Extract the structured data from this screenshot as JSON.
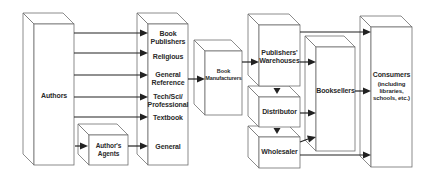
{
  "diagram": {
    "nodes": {
      "authors": {
        "label": "Authors"
      },
      "authors_agents": {
        "label_line1": "Author's",
        "label_line2": "Agents"
      },
      "publishers": {
        "title_line1": "Book",
        "title_line2": "Publishers",
        "categories": [
          {
            "line1": "Religious",
            "line2": ""
          },
          {
            "line1": "General",
            "line2": "Reference"
          },
          {
            "line1": "Tech/Sci/",
            "line2": "Professional"
          },
          {
            "line1": "Textbook",
            "line2": ""
          },
          {
            "line1": "General",
            "line2": ""
          }
        ]
      },
      "manufacturers": {
        "label_line1": "Book",
        "label_line2": "Manufacturers"
      },
      "warehouses": {
        "label_line1": "Publishers'",
        "label_line2": "Warehouses"
      },
      "distributor": {
        "label": "Distributor"
      },
      "wholesaler": {
        "label": "Wholesaler"
      },
      "booksellers": {
        "label": "Booksellers"
      },
      "consumers": {
        "label": "Consumers",
        "sub_line1": "(including",
        "sub_line2": "libraries,",
        "sub_line3": "schools, etc.)"
      }
    },
    "edges": [
      {
        "from": "Authors",
        "to": "Book Publishers"
      },
      {
        "from": "Authors",
        "to": "Religious"
      },
      {
        "from": "Authors",
        "to": "General Reference"
      },
      {
        "from": "Authors",
        "to": "Tech/Sci/Professional"
      },
      {
        "from": "Authors",
        "to": "Textbook"
      },
      {
        "from": "Authors",
        "to": "Author's Agents"
      },
      {
        "from": "Author's Agents",
        "to": "General"
      },
      {
        "from": "Book Publishers",
        "to": "Book Manufacturers"
      },
      {
        "from": "Book Manufacturers",
        "to": "Publishers' Warehouses"
      },
      {
        "from": "Publishers' Warehouses",
        "to": "Distributor"
      },
      {
        "from": "Distributor",
        "to": "Wholesaler"
      },
      {
        "from": "Publishers' Warehouses",
        "to": "Booksellers"
      },
      {
        "from": "Distributor",
        "to": "Booksellers"
      },
      {
        "from": "Wholesaler",
        "to": "Booksellers"
      },
      {
        "from": "Publishers' Warehouses",
        "to": "Consumers"
      },
      {
        "from": "Booksellers",
        "to": "Consumers"
      },
      {
        "from": "Wholesaler",
        "to": "Consumers"
      }
    ],
    "colors": {
      "stroke": "#6e6e6e",
      "arrow": "#222222",
      "text": "#2a2a2a",
      "background": "#ffffff"
    }
  }
}
